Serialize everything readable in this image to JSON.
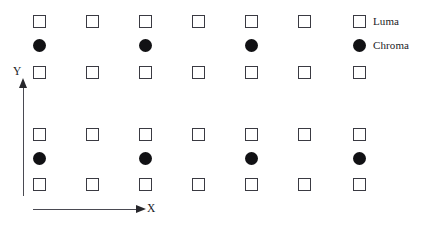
{
  "figure": {
    "background_color": "#ffffff",
    "marker_outline_color": "#3a3a42",
    "marker_fill_color": "#111114",
    "axis_color": "#4a4a52"
  },
  "axes": {
    "x_label": "X",
    "y_label": "Y"
  },
  "legend": {
    "entries": [
      {
        "label": "Luma",
        "marker": "open-square",
        "color": "#ffffff"
      },
      {
        "label": "Chroma",
        "marker": "filled-circle",
        "color": "#111114"
      }
    ]
  },
  "chart_data": {
    "type": "scatter",
    "title": "",
    "subtitle": "",
    "xlabel": "X",
    "ylabel": "Y",
    "grid": false,
    "legend_position": "right",
    "columns": 7,
    "column_x": [
      33,
      86,
      139,
      192,
      245,
      298,
      353
    ],
    "row_y": [
      15,
      39,
      66,
      128,
      152,
      178
    ],
    "series": [
      {
        "name": "Luma",
        "marker": "open-square",
        "points": [
          {
            "x": 33,
            "y": 15
          },
          {
            "x": 86,
            "y": 15
          },
          {
            "x": 139,
            "y": 15
          },
          {
            "x": 192,
            "y": 15
          },
          {
            "x": 245,
            "y": 15
          },
          {
            "x": 298,
            "y": 15
          },
          {
            "x": 353,
            "y": 15
          },
          {
            "x": 33,
            "y": 66
          },
          {
            "x": 86,
            "y": 66
          },
          {
            "x": 139,
            "y": 66
          },
          {
            "x": 192,
            "y": 66
          },
          {
            "x": 245,
            "y": 66
          },
          {
            "x": 298,
            "y": 66
          },
          {
            "x": 353,
            "y": 66
          },
          {
            "x": 33,
            "y": 128
          },
          {
            "x": 86,
            "y": 128
          },
          {
            "x": 139,
            "y": 128
          },
          {
            "x": 192,
            "y": 128
          },
          {
            "x": 245,
            "y": 128
          },
          {
            "x": 298,
            "y": 128
          },
          {
            "x": 353,
            "y": 128
          },
          {
            "x": 33,
            "y": 178
          },
          {
            "x": 86,
            "y": 178
          },
          {
            "x": 139,
            "y": 178
          },
          {
            "x": 192,
            "y": 178
          },
          {
            "x": 245,
            "y": 178
          },
          {
            "x": 298,
            "y": 178
          },
          {
            "x": 353,
            "y": 178
          }
        ]
      },
      {
        "name": "Chroma",
        "marker": "filled-circle",
        "points": [
          {
            "x": 33,
            "y": 39
          },
          {
            "x": 139,
            "y": 39
          },
          {
            "x": 245,
            "y": 39
          },
          {
            "x": 353,
            "y": 39
          },
          {
            "x": 33,
            "y": 152
          },
          {
            "x": 139,
            "y": 152
          },
          {
            "x": 245,
            "y": 152
          },
          {
            "x": 353,
            "y": 152
          }
        ]
      }
    ]
  }
}
